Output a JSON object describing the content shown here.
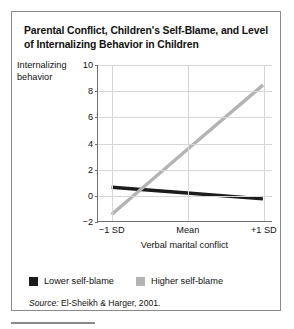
{
  "figure": {
    "title": "Parental Conflict, Children's Self-Blame, and Level of Internalizing Behavior in Children",
    "source_prefix": "Source:",
    "source_text": " El-Sheikh & Harger, 2001."
  },
  "colors": {
    "lower_self_blame": "#1c1c1c",
    "higher_self_blame": "#b3b3b3",
    "axis": "#6f6f6f",
    "grid": "#d6d6d6",
    "frame": "#8a8a8a",
    "text": "#111111"
  },
  "chart_data": {
    "type": "line",
    "title": "Parental Conflict, Children's Self-Blame, and Level of Internalizing Behavior in Children",
    "xlabel": "Verbal marital conflict",
    "ylabel": "Internalizing behavior",
    "ylabel_line1": "Internalizing",
    "ylabel_line2": "behavior",
    "categories": [
      "−1 SD",
      "Mean",
      "+1 SD"
    ],
    "x": [
      0,
      1,
      2
    ],
    "xlim": [
      -0.18,
      2.12
    ],
    "ylim": [
      -2,
      10
    ],
    "yticks": [
      10,
      8,
      6,
      4,
      2,
      0,
      -2
    ],
    "ytick_labels": [
      "10",
      "8",
      "6",
      "4",
      "2",
      "0",
      "−2"
    ],
    "grid": true,
    "legend_position": "below",
    "series": [
      {
        "name": "Lower self-blame",
        "color": "#1c1c1c",
        "values": [
          0.6,
          0.15,
          -0.3
        ]
      },
      {
        "name": "Higher self-blame",
        "color": "#b3b3b3",
        "values": [
          -1.5,
          3.5,
          8.45
        ]
      }
    ]
  }
}
